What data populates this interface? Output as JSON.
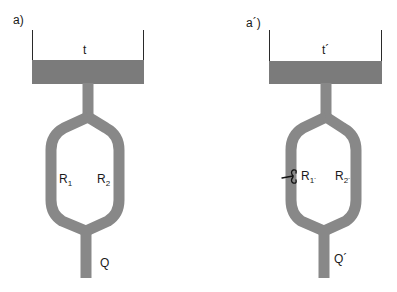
{
  "panels": [
    {
      "id": "a",
      "label": "a)",
      "tank_label": "t",
      "branch_1": {
        "symbol": "R",
        "subscript": "1"
      },
      "branch_2": {
        "symbol": "R",
        "subscript": "2"
      },
      "outflow_label": "Q",
      "clamp_on_branch_1": false
    },
    {
      "id": "a_prime",
      "label": "a´)",
      "tank_label": "t´",
      "branch_1": {
        "symbol": "R",
        "subscript": "1´"
      },
      "branch_2": {
        "symbol": "R",
        "subscript": "2´"
      },
      "outflow_label": "Q´",
      "clamp_on_branch_1": true
    }
  ],
  "colors": {
    "fluid": "#7b7b7b",
    "pipe": "#888888",
    "wall": "#2a2a2a",
    "text": "#1a1a1a",
    "background": "#ffffff"
  }
}
